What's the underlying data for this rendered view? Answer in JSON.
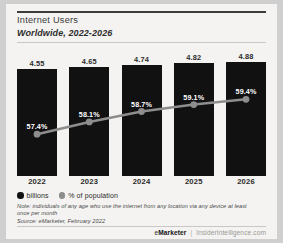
{
  "header": {
    "title": "Internet Users",
    "subtitle": "Worldwide, 2022-2026"
  },
  "legend": [
    {
      "label": "billions",
      "color": "#111111",
      "marker": "filled-circle"
    },
    {
      "label": "% of population",
      "color": "#8d8d8d",
      "marker": "gray-circle"
    }
  ],
  "notes": {
    "note": "Note: individuals of any age who use the internet from any location via any device at least once per month",
    "source": "Source: eMarketer, February 2022"
  },
  "footer": {
    "brand_light": "e",
    "brand_bold": "Marketer",
    "separator": "|",
    "site": "InsiderIntelligence.com"
  },
  "chart_data": {
    "type": "bar",
    "title": "Internet Users",
    "subtitle": "Worldwide, 2022-2026",
    "categories": [
      "2022",
      "2023",
      "2024",
      "2025",
      "2026"
    ],
    "xlabel": "",
    "ylabel": "",
    "grid": false,
    "legend_position": "bottom-left",
    "series": [
      {
        "name": "billions",
        "type": "bar",
        "color": "#111111",
        "values": [
          4.55,
          4.65,
          4.74,
          4.82,
          4.88
        ],
        "labels": [
          "4.55",
          "4.65",
          "4.74",
          "4.82",
          "4.88"
        ],
        "ylim": [
          0,
          5.2
        ]
      },
      {
        "name": "% of population",
        "type": "line",
        "color": "#8d8d8d",
        "values": [
          57.4,
          58.1,
          58.7,
          59.1,
          59.4
        ],
        "labels": [
          "57.4%",
          "58.1%",
          "58.7%",
          "59.1%",
          "59.4%"
        ],
        "ylim": [
          55,
          62
        ]
      }
    ]
  }
}
